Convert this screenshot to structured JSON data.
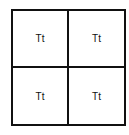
{
  "diagram": {
    "type": "punnett-square",
    "rows": 2,
    "cols": 2,
    "border_color": "#111111",
    "cells": [
      {
        "label": "Tt"
      },
      {
        "label": "Tt"
      },
      {
        "label": "Tt"
      },
      {
        "label": "Tt"
      }
    ]
  }
}
